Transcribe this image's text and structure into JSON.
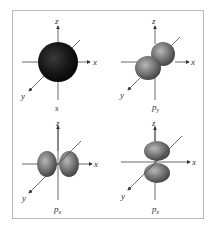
{
  "figure": {
    "frame_color": "#b9b9b9",
    "axis_color": "#444444",
    "axis_labels": {
      "x": "x",
      "y": "y",
      "z": "z"
    },
    "panels": [
      {
        "id": "s",
        "label": "s",
        "sub": "",
        "shape": "sphere",
        "color": "#1a1a1a"
      },
      {
        "id": "py",
        "label": "p",
        "sub": "y",
        "shape": "dumbbell-y",
        "color": "#7a7a7a"
      },
      {
        "id": "px",
        "label": "p",
        "sub": "x",
        "shape": "dumbbell-x",
        "color": "#7a7a7a"
      },
      {
        "id": "pz",
        "label": "p",
        "sub": "z",
        "shape": "dumbbell-z",
        "color": "#7a7a7a"
      }
    ]
  }
}
